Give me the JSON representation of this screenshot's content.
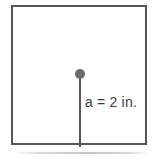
{
  "figure": {
    "type": "geometry-diagram",
    "shape": "square",
    "background_color": "#ffffff",
    "outline_color": "#55565a",
    "dot_color": "#6b6c70",
    "text_color": "#3a3b3e",
    "center_point": {
      "name": "center-dot",
      "visible": true
    },
    "measurement": {
      "variable": "a",
      "value": "2",
      "unit": "in.",
      "label": "a = 2 in."
    },
    "segment": {
      "name": "apothem",
      "from": "center",
      "to": "bottom-edge",
      "visible": true
    }
  }
}
